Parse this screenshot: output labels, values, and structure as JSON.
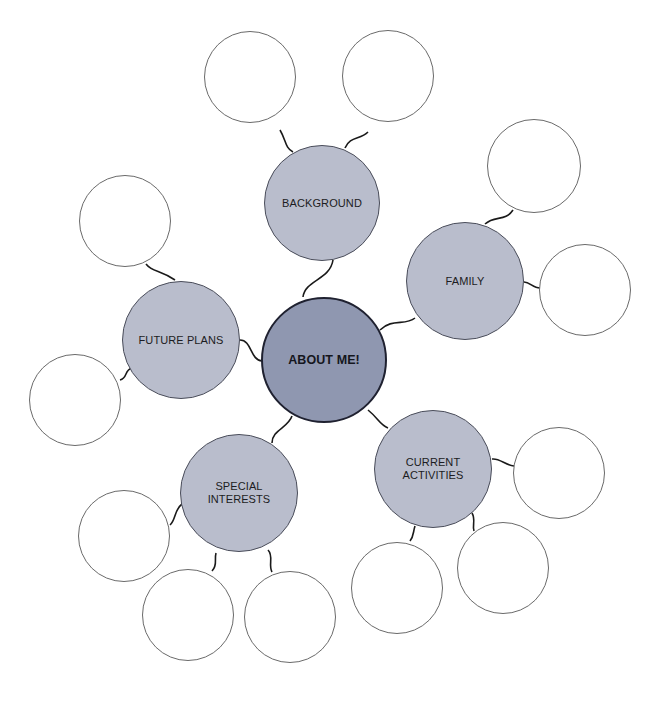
{
  "diagram": {
    "type": "bubble-map",
    "center": {
      "label": "ABOUT ME!",
      "cx": 324,
      "cy": 360,
      "r": 63,
      "color": "#8f97b0"
    },
    "topic_color": "#b9bdcc",
    "topics": [
      {
        "id": "background",
        "label": "BACKGROUND",
        "cx": 322,
        "cy": 203,
        "r": 58,
        "connector": "M333,260 C330,280 305,280 303,297",
        "blanks": [
          {
            "cx": 250,
            "cy": 77,
            "r": 46,
            "connector": "M280,130 C286,140 285,148 293,152"
          },
          {
            "cx": 388,
            "cy": 76,
            "r": 46,
            "connector": "M368,132 C360,140 350,136 345,148"
          }
        ]
      },
      {
        "id": "family",
        "label": "FAMILY",
        "cx": 465,
        "cy": 281,
        "r": 59,
        "connector": "M380,330 C392,318 405,326 415,318",
        "blanks": [
          {
            "cx": 534,
            "cy": 166,
            "r": 47,
            "connector": "M513,210 C505,222 495,215 485,224"
          },
          {
            "cx": 585,
            "cy": 290,
            "r": 46,
            "connector": "M524,282 C530,282 533,288 540,288"
          }
        ]
      },
      {
        "id": "future-plans",
        "label": "FUTURE PLANS",
        "cx": 181,
        "cy": 340,
        "r": 59,
        "connector": "M240,340 C252,340 250,360 262,361",
        "blanks": [
          {
            "cx": 125,
            "cy": 221,
            "r": 46,
            "connector": "M146,264 C152,272 160,270 175,280"
          },
          {
            "cx": 75,
            "cy": 400,
            "r": 46,
            "connector": "M120,380 C128,378 124,370 132,368"
          }
        ]
      },
      {
        "id": "special-interests",
        "label": "SPECIAL\nINTERESTS",
        "cx": 239,
        "cy": 493,
        "r": 59,
        "connector": "M292,416 C288,428 272,430 272,443",
        "blanks": [
          {
            "cx": 124,
            "cy": 536,
            "r": 46,
            "connector": "M170,525 C176,520 174,510 182,504"
          },
          {
            "cx": 188,
            "cy": 615,
            "r": 46,
            "connector": "M216,553 C214,560 218,565 212,571"
          },
          {
            "cx": 290,
            "cy": 617,
            "r": 46,
            "connector": "M268,550 C274,556 268,565 272,572"
          }
        ]
      },
      {
        "id": "current-activities",
        "label": "CURRENT\nACTIVITIES",
        "cx": 433,
        "cy": 469,
        "r": 59,
        "connector": "M368,410 C378,418 380,425 388,428",
        "blanks": [
          {
            "cx": 559,
            "cy": 473,
            "r": 46,
            "connector": "M492,459 C500,458 505,465 514,466"
          },
          {
            "cx": 503,
            "cy": 568,
            "r": 46,
            "connector": "M472,513 C476,520 472,525 474,531"
          },
          {
            "cx": 397,
            "cy": 588,
            "r": 46,
            "connector": "M415,526 C413,532 414,536 410,541"
          }
        ]
      }
    ]
  }
}
